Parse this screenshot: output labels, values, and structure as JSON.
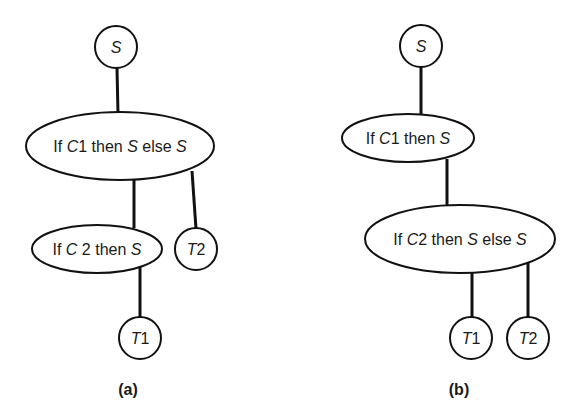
{
  "diagrams": [
    {
      "caption": "(a)",
      "nodes": {
        "root": {
          "text": "S"
        },
        "if1": {
          "parts": [
            "If ",
            "C",
            "1 then ",
            "S",
            " else ",
            "S"
          ]
        },
        "if2": {
          "parts": [
            "If ",
            "C",
            " 2 then ",
            "S"
          ]
        },
        "t1": {
          "parts": [
            "T",
            "1"
          ]
        },
        "t2": {
          "parts": [
            "T",
            "2"
          ]
        }
      },
      "edges": [
        [
          "root",
          "if1"
        ],
        [
          "if1",
          "if2"
        ],
        [
          "if1",
          "t2"
        ],
        [
          "if2",
          "t1"
        ]
      ]
    },
    {
      "caption": "(b)",
      "nodes": {
        "root": {
          "text": "S"
        },
        "if1": {
          "parts": [
            "If ",
            "C",
            "1 then ",
            "S"
          ]
        },
        "if2": {
          "parts": [
            "If ",
            "C",
            "2 then ",
            "S",
            " else ",
            "S"
          ]
        },
        "t1": {
          "parts": [
            "T",
            "1"
          ]
        },
        "t2": {
          "parts": [
            "T",
            "2"
          ]
        }
      },
      "edges": [
        [
          "root",
          "if1"
        ],
        [
          "if1",
          "if2"
        ],
        [
          "if2",
          "t1"
        ],
        [
          "if2",
          "t2"
        ]
      ]
    }
  ]
}
